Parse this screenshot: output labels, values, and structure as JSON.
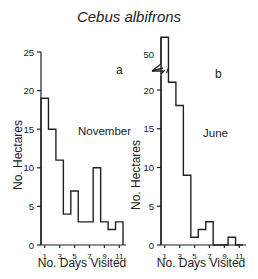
{
  "title": "Cebus albifrons",
  "chart_data": [
    {
      "type": "bar",
      "panel": "a",
      "annotation": "November",
      "title": "",
      "xlabel": "No. Days Visited",
      "ylabel": "No. Hectares",
      "categories": [
        1,
        2,
        3,
        4,
        5,
        6,
        7,
        8,
        9,
        10,
        11
      ],
      "x_tick_labels": [
        "1",
        "3",
        "5",
        "7",
        "9",
        "11"
      ],
      "y_tick_labels": [
        "0",
        "5",
        "10",
        "15",
        "20",
        "25"
      ],
      "values": [
        19,
        15,
        11,
        4,
        7,
        3,
        3,
        10,
        3,
        2,
        3
      ],
      "ylim": [
        0,
        25
      ],
      "grid": false,
      "style": "step histogram outline"
    },
    {
      "type": "bar",
      "panel": "b",
      "annotation": "June",
      "title": "",
      "xlabel": "No. Days Visited",
      "ylabel": "No. Hectares",
      "categories": [
        1,
        2,
        3,
        4,
        5,
        6,
        7,
        8,
        9,
        10,
        11
      ],
      "x_tick_labels": [
        "1",
        "3",
        "5",
        "7",
        "9",
        "11"
      ],
      "y_tick_labels": [
        "0",
        "5",
        "10",
        "15",
        "20",
        "50"
      ],
      "values": [
        56,
        21,
        18,
        9,
        1,
        2,
        3,
        0,
        0,
        1,
        0
      ],
      "ylim": [
        0,
        55
      ],
      "axis_break": "between 22 and 50",
      "grid": false,
      "style": "step histogram outline"
    }
  ],
  "panels": {
    "a": {
      "letter": "a",
      "month": "November",
      "xlabel": "No. Days Visited",
      "ylabel": "No. Hectares"
    },
    "b": {
      "letter": "b",
      "month": "June",
      "xlabel": "No. Days Visited",
      "ylabel": "No. Hectares"
    }
  }
}
